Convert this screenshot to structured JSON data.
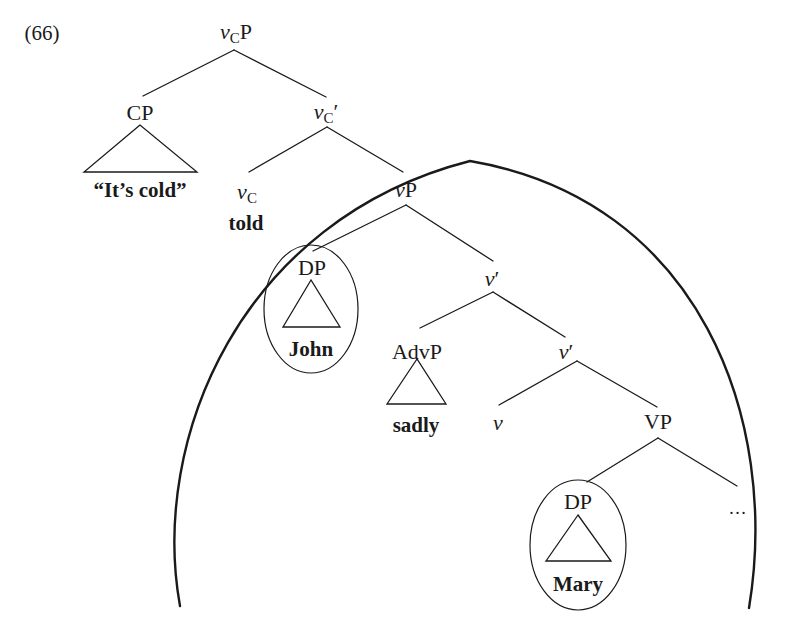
{
  "example_number": "(66)",
  "nodes": {
    "root": {
      "italic": "v",
      "sub": "C",
      "rest": "P"
    },
    "cp": {
      "label": "CP"
    },
    "cp_terminal": {
      "label": "“It’s cold”"
    },
    "vc_bar": {
      "italic": "v",
      "sub": "C",
      "rest": "′"
    },
    "vc_head": {
      "italic": "v",
      "sub": "C"
    },
    "vc_terminal": {
      "label": "told"
    },
    "vp_little": {
      "italic": "v",
      "rest": "P"
    },
    "dp_subject": {
      "label": "DP"
    },
    "dp_subject_terminal": {
      "label": "John"
    },
    "v_bar_1": {
      "italic": "v",
      "rest": "′"
    },
    "advp": {
      "label": "AdvP"
    },
    "advp_terminal": {
      "label": "sadly"
    },
    "v_bar_2": {
      "italic": "v",
      "rest": "′"
    },
    "v_head": {
      "italic": "v"
    },
    "vp": {
      "label": "VP"
    },
    "dp_object": {
      "label": "DP"
    },
    "dp_object_terminal": {
      "label": "Mary"
    },
    "ellipsis": {
      "label": "…"
    }
  },
  "colors": {
    "ink": "#1a1a1a",
    "background": "#ffffff"
  }
}
